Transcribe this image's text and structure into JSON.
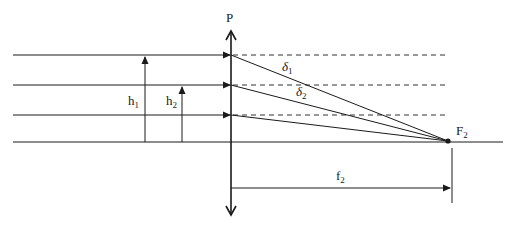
{
  "diagram": {
    "type": "optics-lens-focusing",
    "labels": {
      "lens": "P",
      "h1_main": "h",
      "h1_sub": "1",
      "h2_main": "h",
      "h2_sub": "2",
      "delta1_main": "δ",
      "delta1_sub": "1",
      "delta2_main": "δ",
      "delta2_sub": "2",
      "focus_main": "F",
      "focus_sub": "2",
      "focal_length_main": "f",
      "focal_length_sub": "2"
    },
    "elements": {
      "lens": {
        "x": 231,
        "y_top": 30,
        "y_bottom": 215
      },
      "optical_axis_y": 142,
      "incident_rays_y": [
        55,
        85,
        115
      ],
      "focal_point": {
        "x": 448,
        "y": 141
      },
      "heights": [
        {
          "name": "h1",
          "x": 145,
          "from_y": 142,
          "to_y": 55
        },
        {
          "name": "h2",
          "x": 182,
          "from_y": 142,
          "to_y": 85
        }
      ],
      "focal_length_line": {
        "y": 188,
        "x_start": 231,
        "x_end": 450
      },
      "colors": {
        "stroke": "#1a1a1a",
        "background": "#ffffff"
      }
    }
  }
}
